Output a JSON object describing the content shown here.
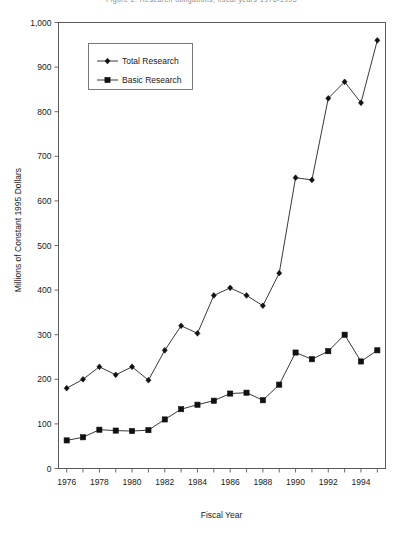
{
  "top_caption": "Figure 2.  Research obligations, fiscal years 1976-1995",
  "axis_titles": {
    "y": "Millions of Constant 1995 Dollars",
    "x": "Fiscal Year"
  },
  "legend": {
    "items": [
      {
        "label": "Total Research",
        "marker": "diamond"
      },
      {
        "label": "Basic Research",
        "marker": "square"
      }
    ]
  },
  "chart_data": {
    "type": "line",
    "title": "",
    "xlabel": "Fiscal Year",
    "ylabel": "Millions of Constant 1995 Dollars",
    "xlim": [
      1975.5,
      1995.5
    ],
    "ylim": [
      0,
      1000
    ],
    "yticks": [
      0,
      100,
      200,
      300,
      400,
      500,
      600,
      700,
      800,
      900,
      1000
    ],
    "ytick_labels": [
      "0",
      "100",
      "200",
      "300",
      "400",
      "500",
      "600",
      "700",
      "800",
      "900",
      "1,000"
    ],
    "xticks": [
      1976,
      1977,
      1978,
      1979,
      1980,
      1981,
      1982,
      1983,
      1984,
      1985,
      1986,
      1987,
      1988,
      1989,
      1990,
      1991,
      1992,
      1993,
      1994,
      1995
    ],
    "xtick_labels_shown": [
      "1976",
      "1978",
      "1980",
      "1982",
      "1984",
      "1986",
      "1988",
      "1990",
      "1992",
      "1994"
    ],
    "xtick_label_step": 2,
    "grid": false,
    "legend_position": "upper-left-inset",
    "x": [
      1976,
      1977,
      1978,
      1979,
      1980,
      1981,
      1982,
      1983,
      1984,
      1985,
      1986,
      1987,
      1988,
      1989,
      1990,
      1991,
      1992,
      1993,
      1994,
      1995
    ],
    "series": [
      {
        "name": "Total Research",
        "marker": "diamond",
        "values": [
          180,
          200,
          228,
          210,
          228,
          198,
          265,
          320,
          303,
          388,
          405,
          388,
          365,
          438,
          652,
          647,
          830,
          867,
          820,
          960
        ]
      },
      {
        "name": "Basic Research",
        "marker": "square",
        "values": [
          63,
          70,
          87,
          85,
          84,
          86,
          110,
          133,
          143,
          152,
          168,
          170,
          153,
          188,
          260,
          245,
          263,
          300,
          240,
          265
        ]
      }
    ]
  }
}
